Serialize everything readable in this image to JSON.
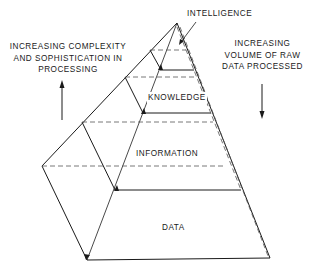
{
  "diagram": {
    "type": "pyramid",
    "levels": [
      {
        "label": "INTELLIGENCE",
        "order": 1
      },
      {
        "label": "KNOWLEDGE",
        "order": 2
      },
      {
        "label": "INFORMATION",
        "order": 3
      },
      {
        "label": "DATA",
        "order": 4
      }
    ],
    "left_annotation": {
      "lines": [
        "INCREASING COMPLEXITY",
        "AND SOPHISTICATION IN",
        "PROCESSING"
      ],
      "arrow_direction": "up"
    },
    "right_annotation": {
      "lines": [
        "INCREASING",
        "VOLUME OF RAW",
        "DATA PROCESSED"
      ],
      "arrow_direction": "down"
    },
    "colors": {
      "line": "#1a1a1a",
      "dashed": "#555555",
      "background": "#ffffff"
    }
  }
}
